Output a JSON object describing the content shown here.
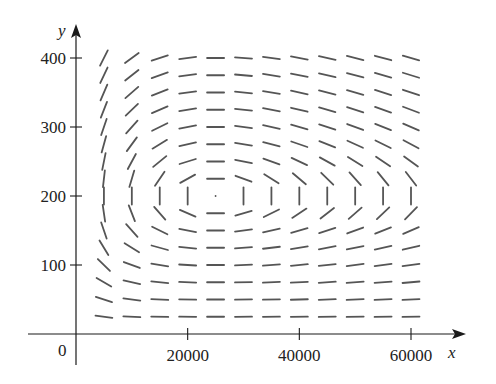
{
  "chart_data": {
    "type": "direction_field",
    "title": "",
    "xlabel": "x",
    "ylabel": "y",
    "origin_label": "0",
    "x_ticks": [
      20000,
      40000,
      60000
    ],
    "x_tick_labels": [
      "20000",
      "40000",
      "60000"
    ],
    "y_ticks": [
      100,
      200,
      300,
      400
    ],
    "y_tick_labels": [
      "100",
      "200",
      "300",
      "400"
    ],
    "xlim": [
      0,
      60000
    ],
    "ylim": [
      0,
      400
    ],
    "grid": false,
    "legend": null,
    "field_grid": {
      "x_start": 5000,
      "x_step": 5000,
      "x_count": 12,
      "y_start": 25,
      "y_step": 25,
      "y_count": 16
    },
    "slope_model": {
      "description": "Lotka-Volterra predator-prey direction field dy/dx = y(-a + b x) / (x(k - c y))",
      "a": 0.02,
      "b": 8e-07,
      "k": 0.08,
      "c": 0.0004,
      "equilibrium": [
        25000,
        200
      ]
    },
    "colors": {
      "axis": "#1a1a1a",
      "segment": "#555555",
      "text": "#222222"
    }
  }
}
